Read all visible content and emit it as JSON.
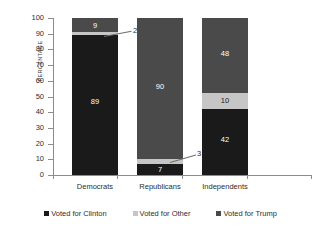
{
  "chart_data": {
    "type": "bar",
    "subtype": "stacked-bar-100",
    "title": "",
    "xlabel": "",
    "ylabel": "PERCENTAGE",
    "ylim": [
      0,
      100
    ],
    "yticks": [
      0,
      10,
      20,
      30,
      40,
      50,
      60,
      70,
      80,
      90,
      100
    ],
    "grid": false,
    "legend_position": "bottom",
    "categories": [
      "Democrats",
      "Republicans",
      "Independents"
    ],
    "series": [
      {
        "name": "Voted for Clinton",
        "color": "#1a1a1a",
        "values": [
          89,
          7,
          42
        ]
      },
      {
        "name": "Voted for Other",
        "color": "#c6c6c6",
        "values": [
          2,
          3,
          10
        ]
      },
      {
        "name": "Voted for Trump",
        "color": "#4a4a4a",
        "values": [
          9,
          90,
          48
        ]
      }
    ],
    "data_labels": {
      "Democrats": {
        "Voted for Clinton": "89",
        "Voted for Other": "2",
        "Voted for Trump": "9"
      },
      "Republicans": {
        "Voted for Clinton": "7",
        "Voted for Other": "3",
        "Voted for Trump": "90"
      },
      "Independents": {
        "Voted for Clinton": "42",
        "Voted for Other": "10",
        "Voted for Trump": "48"
      }
    },
    "callouts": [
      {
        "label": "2",
        "category": "Democrats",
        "series": "Voted for Other"
      },
      {
        "label": "3",
        "category": "Republicans",
        "series": "Voted for Other"
      }
    ]
  },
  "axis": {
    "y_title": "PERCENTAGE",
    "y_tick_labels": [
      "100",
      "90",
      "80",
      "70",
      "60",
      "50",
      "40",
      "30",
      "20",
      "10",
      "0"
    ],
    "x_tick_labels": [
      "Democrats",
      "Republicans",
      "Independents"
    ]
  },
  "legend": {
    "items": [
      {
        "label": "Voted for Clinton",
        "color": "#1a1a1a"
      },
      {
        "label": "Voted for Other",
        "color": "#c6c6c6"
      },
      {
        "label": "Voted for Trump",
        "color": "#4a4a4a"
      }
    ]
  },
  "bars": {
    "democrats": {
      "clinton_label": "89",
      "other_label": "2",
      "trump_label": "9"
    },
    "republicans": {
      "clinton_label": "7",
      "other_label": "3",
      "trump_label": "90"
    },
    "independents": {
      "clinton_label": "42",
      "other_label": "10",
      "trump_label": "48"
    }
  }
}
